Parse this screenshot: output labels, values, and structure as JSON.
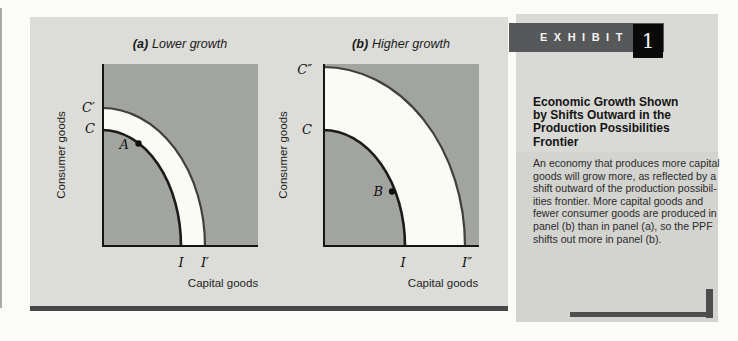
{
  "exhibit": {
    "label": "EXHIBIT",
    "number": "1"
  },
  "sidebar": {
    "title_lines": [
      "Economic Growth Shown",
      "by Shifts Outward in the",
      "Production Possibilities",
      "Frontier"
    ],
    "body_lines": [
      "An economy that produces more capital",
      "goods will grow more, as reflected by a",
      "shift outward of the production possibil-",
      "ities frontier. More capital goods and",
      "fewer consumer goods are produced in",
      "panel (b) than in panel (a), so the PPF",
      "shifts out more in panel (b)."
    ]
  },
  "panel_a": {
    "title_prefix": "(a)",
    "title_rest": "Lower growth",
    "ylabel": "Consumer goods",
    "xlabel": "Capital goods",
    "ytick_outer": "C′",
    "ytick_inner": "C",
    "xtick_inner": "I",
    "xtick_outer": "I′",
    "point_label": "A"
  },
  "panel_b": {
    "title_prefix": "(b)",
    "title_rest": "Higher growth",
    "ylabel": "Consumer goods",
    "xlabel": "Capital goods",
    "ytick_outer": "C″",
    "ytick_inner": "C",
    "xtick_inner": "I",
    "xtick_outer": "I″",
    "point_label": "B"
  },
  "colors": {
    "plot_background": "#a2a4a0",
    "growth_band": "#fbfbf6",
    "panel_background": "#dcdcd8",
    "sidebar_background": "#d9d9d6",
    "exhibit_bar": "#57585a",
    "exhibit_number_box": "#0a0a0a",
    "curve_inner": "#1b1b1b",
    "curve_outer": "#3f3f3d"
  }
}
